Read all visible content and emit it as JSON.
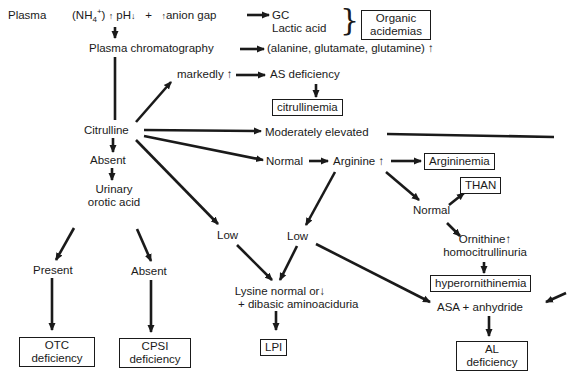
{
  "diagram": {
    "plasma_label": "Plasma",
    "plasma_findings": {
      "ammonia": "(NH4+)",
      "ammonia_arrow": "↑",
      "ph": "pH",
      "ph_arrow": "↓",
      "plus": "+",
      "anion_gap_arrow": "↑",
      "anion_gap": "anion gap"
    },
    "gc": "GC",
    "lactic_acid": "Lactic acid",
    "organic_acidemias": [
      "Organic",
      "acidemias"
    ],
    "plasma_chromatography": "Plasma chromatography",
    "amino_acids": "(alanine, glutamate, glutamine) ↑",
    "markedly": "markedly ↑",
    "as_deficiency": "AS deficiency",
    "citrullinemia": "citrullinemia",
    "citrulline": "Citrulline",
    "moderately_elevated": "Moderately elevated",
    "normal_1": "Normal",
    "arginine": "Arginine ↑",
    "argininemia": "Argininemia",
    "than": "THAN",
    "normal_2": "Normal",
    "ornithine": "Ornithine↑",
    "homocitrullinuria": "homocitrullinuria",
    "hyperornithinemia": "hyperornithinemia",
    "absent_1": "Absent",
    "urinary_orotic_acid": [
      "Urinary",
      "orotic acid"
    ],
    "present": "Present",
    "absent_2": "Absent",
    "otc_deficiency": [
      "OTC",
      "deficiency"
    ],
    "cpsi_deficiency": [
      "CPSI",
      "deficiency"
    ],
    "low_1": "Low",
    "low_2": "Low",
    "lysine": [
      "Lysine normal or↓",
      "+ dibasic aminoaciduria"
    ],
    "lpi": "LPI",
    "asa_anhydride": "ASA + anhydride",
    "al_deficiency": [
      "AL",
      "deficiency"
    ]
  }
}
